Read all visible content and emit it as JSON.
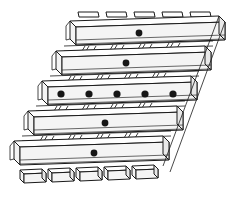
{
  "figure": {
    "type": "technical-line-drawing",
    "projection": "oblique",
    "background_color": "#ffffff",
    "line_color": "#1a1a1a",
    "hole_color": "#161616",
    "face_fill_top": "#fefefe",
    "face_fill_side": "#f4f4f4",
    "face_fill_end": "#e9e9e9"
  },
  "geometry": {
    "canvas": {
      "width": 234,
      "height": 200
    },
    "shear": {
      "dx_per_band": -28,
      "band_pitch_y": 30
    },
    "band_count": 5,
    "band_length": 155,
    "band_height": 17,
    "band_depth": 6,
    "top_tab_count": 5,
    "bottom_foot_count": 5,
    "slot_group_count": 4,
    "slots_per_group": 3
  },
  "bands": [
    {
      "index": 1,
      "name": "slat-band-top",
      "origin_x": 70,
      "origin_y": 16,
      "holes": [
        {
          "cx": 139,
          "cy": 33,
          "r": 3.4
        }
      ],
      "hole_count": 1
    },
    {
      "index": 2,
      "name": "slat-band-upper",
      "origin_x": 56,
      "origin_y": 46,
      "holes": [
        {
          "cx": 126,
          "cy": 63,
          "r": 3.4
        }
      ],
      "hole_count": 1
    },
    {
      "index": 3,
      "name": "slat-band-middle",
      "origin_x": 42,
      "origin_y": 76,
      "holes": [
        {
          "cx": 61,
          "cy": 94,
          "r": 3.6
        },
        {
          "cx": 89,
          "cy": 94,
          "r": 3.6
        },
        {
          "cx": 117,
          "cy": 94,
          "r": 3.6
        },
        {
          "cx": 145,
          "cy": 94,
          "r": 3.6
        },
        {
          "cx": 173,
          "cy": 94,
          "r": 3.6
        }
      ],
      "hole_count": 5
    },
    {
      "index": 4,
      "name": "slat-band-lower",
      "origin_x": 28,
      "origin_y": 106,
      "holes": [
        {
          "cx": 105,
          "cy": 123,
          "r": 3.4
        }
      ],
      "hole_count": 1
    },
    {
      "index": 5,
      "name": "slat-band-bottom",
      "origin_x": 14,
      "origin_y": 136,
      "holes": [
        {
          "cx": 94,
          "cy": 153,
          "r": 3.4
        }
      ],
      "hole_count": 1
    }
  ],
  "top_tabs": [
    {
      "index": 1,
      "x": 78
    },
    {
      "index": 2,
      "x": 106
    },
    {
      "index": 3,
      "x": 134
    },
    {
      "index": 4,
      "x": 162
    },
    {
      "index": 5,
      "x": 190
    }
  ],
  "bottom_feet": [
    {
      "index": 1,
      "x": 20
    },
    {
      "index": 2,
      "x": 48
    },
    {
      "index": 3,
      "x": 76
    },
    {
      "index": 4,
      "x": 104
    },
    {
      "index": 5,
      "x": 132
    }
  ],
  "slot_rows": [
    {
      "index": 1,
      "after_band": 1,
      "y": 48,
      "start_x": 76
    },
    {
      "index": 2,
      "after_band": 2,
      "y": 78,
      "start_x": 62
    },
    {
      "index": 3,
      "after_band": 3,
      "y": 108,
      "start_x": 48
    },
    {
      "index": 4,
      "after_band": 4,
      "y": 138,
      "start_x": 34
    }
  ],
  "hole_totals": {
    "total": 9,
    "per_band": [
      1,
      1,
      5,
      1,
      1
    ]
  }
}
